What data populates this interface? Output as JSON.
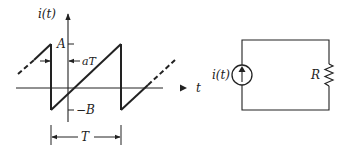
{
  "waveform": {
    "y_axis_label": "i(t)",
    "x_axis_label": "t",
    "peak_label": "A",
    "trough_label": "−B",
    "delay_label": "aT",
    "period_label": "T"
  },
  "circuit": {
    "source_label": "i(t)",
    "resistor_label": "R"
  },
  "colors": {
    "ink": "#222222",
    "background": "#ffffff"
  }
}
